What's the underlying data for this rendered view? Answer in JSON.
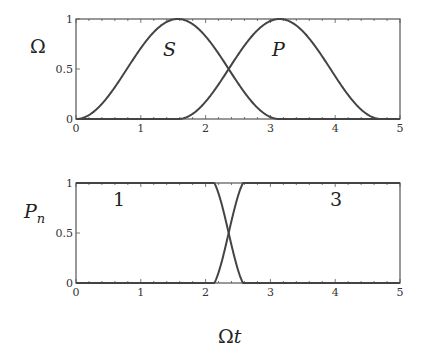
{
  "chart_data": [
    {
      "type": "line",
      "panel": "top",
      "title": "",
      "xlabel": "",
      "ylabel": "Ω",
      "xlim": [
        0,
        5
      ],
      "ylim": [
        0,
        1
      ],
      "xticks": [
        "0",
        "1",
        "2",
        "3",
        "4",
        "5"
      ],
      "yticks": [
        "0",
        "0.5",
        "1"
      ],
      "grid": false,
      "annotations": [
        {
          "text": "S",
          "x": 1.3,
          "y": 0.75
        },
        {
          "text": "P",
          "x": 2.95,
          "y": 0.75
        }
      ],
      "series": [
        {
          "name": "S",
          "x": [
            0,
            0.25,
            0.5,
            0.75,
            1.0,
            1.25,
            1.5,
            1.571,
            1.75,
            2.0,
            2.25,
            2.5,
            2.75,
            3.0,
            3.142,
            5.0
          ],
          "values": [
            0,
            0.06,
            0.23,
            0.46,
            0.71,
            0.9,
            0.99,
            1.0,
            0.97,
            0.83,
            0.61,
            0.36,
            0.15,
            0.02,
            0,
            0
          ]
        },
        {
          "name": "P",
          "x": [
            0,
            1.571,
            1.75,
            2.0,
            2.25,
            2.5,
            2.75,
            3.0,
            3.142,
            3.25,
            3.5,
            3.75,
            4.0,
            4.25,
            4.5,
            4.712,
            5.0
          ],
          "values": [
            0,
            0,
            0.03,
            0.17,
            0.39,
            0.64,
            0.85,
            0.98,
            1.0,
            0.99,
            0.93,
            0.76,
            0.54,
            0.3,
            0.1,
            0,
            0
          ]
        }
      ]
    },
    {
      "type": "line",
      "panel": "bottom",
      "title": "",
      "xlabel": "Ωt",
      "ylabel": "P_n",
      "xlim": [
        0,
        5
      ],
      "ylim": [
        0,
        1
      ],
      "xticks": [
        "0",
        "1",
        "2",
        "3",
        "4",
        "5"
      ],
      "yticks": [
        "0",
        "0.5",
        "1"
      ],
      "grid": false,
      "annotations": [
        {
          "text": "1",
          "x": 0.6,
          "y": 0.85
        },
        {
          "text": "3",
          "x": 4.1,
          "y": 0.85
        }
      ],
      "series": [
        {
          "name": "1",
          "x": [
            0,
            1.8,
            1.9,
            2.0,
            2.1,
            2.2,
            2.3,
            2.36,
            2.4,
            2.5,
            2.6,
            2.7,
            2.8,
            2.9,
            5.0
          ],
          "values": [
            1,
            1,
            0.99,
            0.96,
            0.89,
            0.76,
            0.58,
            0.5,
            0.44,
            0.27,
            0.13,
            0.05,
            0.01,
            0,
            0
          ]
        },
        {
          "name": "3",
          "x": [
            0,
            1.8,
            1.9,
            2.0,
            2.1,
            2.2,
            2.3,
            2.36,
            2.4,
            2.5,
            2.6,
            2.7,
            2.8,
            2.9,
            5.0
          ],
          "values": [
            0,
            0,
            0.01,
            0.04,
            0.11,
            0.24,
            0.42,
            0.5,
            0.56,
            0.73,
            0.87,
            0.95,
            0.99,
            1,
            1
          ]
        }
      ]
    }
  ],
  "labels": {
    "top_ylabel": "Ω",
    "bottom_ylabel_main": "P",
    "bottom_ylabel_sub": "n",
    "xlabel_omega": "Ω",
    "xlabel_t": "t",
    "ann_S": "S",
    "ann_P": "P",
    "ann_1": "1",
    "ann_3": "3"
  },
  "ticks": {
    "x": [
      "0",
      "1",
      "2",
      "3",
      "4",
      "5"
    ],
    "y_top": [
      "1",
      "0.5",
      "0"
    ],
    "y_bottom": [
      "1",
      "0.5",
      "0"
    ]
  },
  "colors": {
    "curve": "#444444",
    "frame": "#555555",
    "text": "#222222"
  }
}
